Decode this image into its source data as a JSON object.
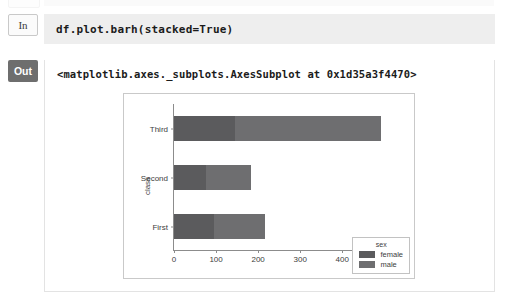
{
  "notebook": {
    "input_cell": {
      "prompt_label": "In",
      "code": "df.plot.barh(stacked=True)"
    },
    "output_cell": {
      "prompt_label": "Out",
      "repr_text": "<matplotlib.axes._subplots.AxesSubplot at 0x1d35a3f4470>"
    }
  },
  "chart_data": {
    "type": "bar",
    "orientation": "horizontal",
    "stacked": true,
    "title": "",
    "xlabel": "",
    "ylabel": "class",
    "categories": [
      "First",
      "Second",
      "Third"
    ],
    "series": [
      {
        "name": "female",
        "values": [
          94,
          76,
          144
        ],
        "color": "#5b5b5d"
      },
      {
        "name": "male",
        "values": [
          122,
          108,
          347
        ],
        "color": "#6e6e70"
      }
    ],
    "totals": [
      216,
      184,
      491
    ],
    "xlim": [
      0,
      530
    ],
    "xticks": [
      0,
      100,
      200,
      300,
      400,
      500
    ],
    "xtick_labels": [
      "0",
      "100",
      "200",
      "300",
      "400",
      "500"
    ],
    "ytick_labels": [
      "Third",
      "Second",
      "First"
    ],
    "grid": false,
    "legend": {
      "title": "sex",
      "position": "lower right",
      "entries": [
        {
          "label": "female",
          "color": "#5b5b5d"
        },
        {
          "label": "male",
          "color": "#6e6e70"
        }
      ]
    }
  }
}
